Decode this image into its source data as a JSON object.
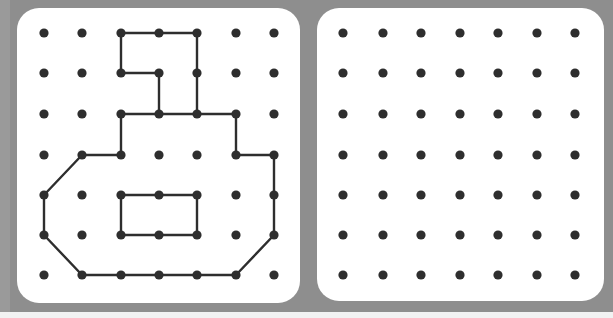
{
  "colors": {
    "frame": "#8e8e8e",
    "panel": "#ffffff",
    "dot": "#2e2e2e",
    "line": "#2e2e2e"
  },
  "grid": {
    "columns": 7,
    "rows": 7
  },
  "panels": [
    {
      "name": "model-board",
      "dots_x": [
        44,
        82,
        121,
        159,
        197,
        236,
        274
      ],
      "dots_y": [
        33,
        73,
        114,
        155,
        195,
        235,
        275
      ],
      "figure": {
        "outer_polygon": [
          [
            2,
            0
          ],
          [
            3,
            0
          ],
          [
            4,
            0
          ],
          [
            4,
            1
          ],
          [
            4,
            2
          ],
          [
            5,
            2
          ],
          [
            5,
            3
          ],
          [
            6,
            3
          ],
          [
            6,
            4
          ],
          [
            6,
            5
          ],
          [
            5,
            6
          ],
          [
            4,
            6
          ],
          [
            3,
            6
          ],
          [
            2,
            6
          ],
          [
            1,
            6
          ],
          [
            0,
            5
          ],
          [
            0,
            4
          ],
          [
            1,
            3
          ],
          [
            2,
            3
          ],
          [
            2,
            2
          ],
          [
            3,
            2
          ],
          [
            3,
            1
          ],
          [
            2,
            1
          ],
          [
            2,
            0
          ]
        ],
        "extra_segments": [
          [
            [
              3,
              2
            ],
            [
              4,
              2
            ]
          ]
        ],
        "inner_rectangle": [
          [
            2,
            4
          ],
          [
            3,
            4
          ],
          [
            4,
            4
          ],
          [
            4,
            5
          ],
          [
            3,
            5
          ],
          [
            2,
            5
          ],
          [
            2,
            4
          ]
        ]
      }
    },
    {
      "name": "blank-board",
      "dots_x": [
        343,
        383,
        421,
        460,
        498,
        537,
        575
      ],
      "dots_y": [
        33,
        73,
        114,
        155,
        195,
        235,
        275
      ],
      "figure": null
    }
  ]
}
